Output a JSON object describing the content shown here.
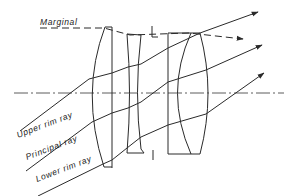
{
  "figure": {
    "type": "optical lens ray diagram",
    "background": "#ffffff",
    "line_color": "#2a2a2a"
  },
  "labels": {
    "marginal": "Marginal",
    "upper_rim_ray": "Upper rim ray",
    "principal_ray": "Principal ray",
    "lower_rim_ray": "Lower rim ray"
  },
  "elements": {
    "optical_axis": "dash-dot horizontal line",
    "lens_1": "plano-convex front element",
    "lens_2": "biconcave middle element",
    "aperture_stop": "stop markers above and below axis",
    "lens_3": "cemented rear doublet"
  },
  "rays": [
    {
      "name": "Marginal",
      "style": "dashed",
      "arrow": true
    },
    {
      "name": "Upper rim ray",
      "style": "solid",
      "arrow": true
    },
    {
      "name": "Principal ray",
      "style": "solid",
      "arrow": true
    },
    {
      "name": "Lower rim ray",
      "style": "solid",
      "arrow": true
    }
  ]
}
